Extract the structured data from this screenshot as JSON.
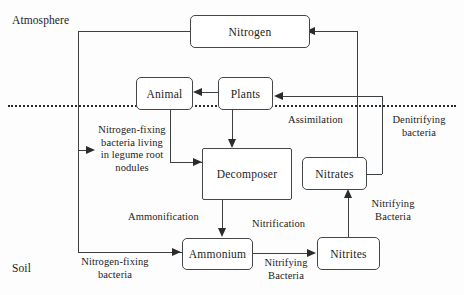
{
  "diagram": {
    "type": "flow-diagram"
  },
  "zones": {
    "atmosphere_label": "Atmosphere",
    "soil_label": "Soil"
  },
  "nodes": {
    "nitrogen": "Nitrogen",
    "animal": "Animal",
    "plants": "Plants",
    "decomposer": "Decomposer",
    "nitrates": "Nitrates",
    "ammonium": "Ammonium",
    "nitrites": "Nitrites"
  },
  "edge_labels": {
    "legume": "Nitrogen-fixing\nbacteria living\nin legume root\nnodules",
    "assimilation": "Assimilation",
    "denitrifying": "Denitrifying\nbacteria",
    "ammonification": "Ammonification",
    "nitrification": "Nitrification",
    "nitrifying_bacteria_lower": "Nitrifying\nBacteria",
    "nitrifying_bacteria_right": "Nitrifying\nBacteria",
    "nitrogen_fixing_soil": "Nitrogen-fixing\nbacteria"
  },
  "colors": {
    "stroke": "#3d4043",
    "box_border": "#44474a",
    "text": "#1c1c1c",
    "divider": "#2b2b2b",
    "background": "#fdfdfd"
  }
}
